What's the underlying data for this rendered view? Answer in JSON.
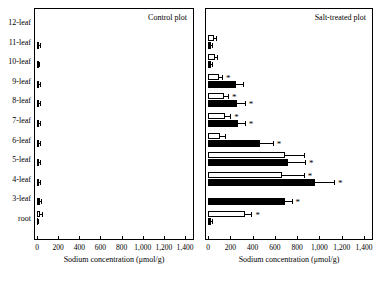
{
  "chart_data": {
    "type": "bar",
    "title": "",
    "panels": [
      {
        "name": "control",
        "title": "Control plot",
        "xlabel": "Sodium concentration (μmol/g)",
        "xlim": [
          0,
          1400
        ],
        "xticks": [
          0,
          200,
          400,
          600,
          800,
          1000,
          1200,
          1400
        ],
        "xticklabels": [
          "0",
          "200",
          "400",
          "600",
          "800",
          "1,000",
          "1,200",
          "1,400"
        ],
        "categories": [
          "12-leaf",
          "11-leaf",
          "10-leaf",
          "9-leaf",
          "8-leaf",
          "7-leaf",
          "6-leaf",
          "5-leaf",
          "4-leaf",
          "3-leaf",
          "root"
        ],
        "series": [
          {
            "name": "solid",
            "color": "#000000",
            "values": [
              null,
              18,
              16,
              18,
              22,
              20,
              20,
              20,
              22,
              24,
              8
            ],
            "errors": [
              null,
              6,
              6,
              7,
              8,
              8,
              8,
              8,
              9,
              10,
              4
            ]
          },
          {
            "name": "open",
            "color": "#ffffff",
            "values": [
              null,
              null,
              null,
              null,
              null,
              null,
              null,
              null,
              null,
              null,
              30
            ],
            "errors": [
              null,
              null,
              null,
              null,
              null,
              null,
              null,
              null,
              null,
              null,
              14
            ]
          }
        ],
        "significance": []
      },
      {
        "name": "salt-treated",
        "title": "Salt-treated plot",
        "xlabel": "Sodium concentration (μmol/g)",
        "xlim": [
          0,
          1400
        ],
        "xticks": [
          0,
          200,
          400,
          600,
          800,
          1000,
          1200,
          1400
        ],
        "xticklabels": [
          "0",
          "200",
          "400",
          "600",
          "800",
          "1,000",
          "1,200",
          "1,400"
        ],
        "categories": [
          "12-leaf",
          "11-leaf",
          "10-leaf",
          "9-leaf",
          "8-leaf",
          "7-leaf",
          "6-leaf",
          "5-leaf",
          "4-leaf",
          "3-leaf",
          "root"
        ],
        "series": [
          {
            "name": "solid",
            "color": "#000000",
            "values": [
              null,
              28,
              30,
              250,
              260,
              270,
              470,
              720,
              960,
              690,
              25
            ],
            "errors": [
              null,
              10,
              10,
              60,
              70,
              60,
              110,
              150,
              170,
              60,
              10
            ]
          },
          {
            "name": "open",
            "color": "#ffffff",
            "values": [
              null,
              55,
              60,
              95,
              140,
              150,
              110,
              690,
              660,
              null,
              330
            ],
            "errors": [
              null,
              20,
              20,
              30,
              40,
              50,
              40,
              170,
              200,
              null,
              60
            ]
          }
        ],
        "significance": [
          "9-leaf-open",
          "8-leaf-solid",
          "8-leaf-open",
          "7-leaf-solid",
          "7-leaf-open",
          "6-leaf-solid",
          "5-leaf-solid",
          "4-leaf-solid",
          "4-leaf-open",
          "3-leaf-solid",
          "root-open"
        ]
      }
    ]
  },
  "axis": {
    "xlabel": "Sodium concentration (μmol/g)",
    "ticklabels": [
      "0",
      "200",
      "400",
      "600",
      "800",
      "1,000",
      "1,200",
      "1,400"
    ],
    "ylabels": [
      "12-leaf",
      "11-leaf",
      "10-leaf",
      "9-leaf",
      "8-leaf",
      "7-leaf",
      "6-leaf",
      "5-leaf",
      "4-leaf",
      "3-leaf",
      "root"
    ],
    "star": "*"
  },
  "panel_titles": {
    "left": "Control plot",
    "right": "Salt-treated plot"
  }
}
